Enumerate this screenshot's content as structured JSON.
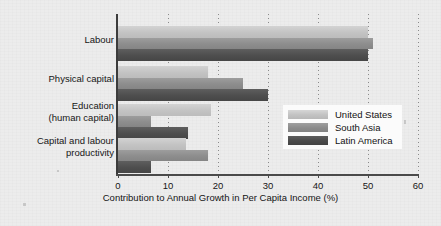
{
  "chart_data": {
    "type": "bar",
    "orientation": "horizontal",
    "title": "",
    "xlabel": "Contribution to Annual Growth in Per Capita Income (%)",
    "ylabel": "",
    "xlim": [
      0,
      60
    ],
    "xticks": [
      0,
      10,
      20,
      30,
      40,
      50,
      60
    ],
    "grid": true,
    "legend_position": "center-right",
    "categories": [
      "Labour",
      "Physical capital",
      "Education\n(human capital)",
      "Capital and labour\nproductivity"
    ],
    "series": [
      {
        "name": "United States",
        "color": "#c6c6c6",
        "values": [
          50,
          18,
          18.5,
          13.5
        ]
      },
      {
        "name": "South Asia",
        "color": "#8d8d8d",
        "values": [
          51,
          25,
          6.5,
          18
        ]
      },
      {
        "name": "Latin America",
        "color": "#4c4c4c",
        "values": [
          50,
          30,
          14,
          6.5
        ]
      }
    ]
  },
  "axis": {
    "tick_labels": [
      "0",
      "10",
      "20",
      "30",
      "40",
      "50",
      "60"
    ],
    "title": "Contribution to Annual Growth in Per Capita Income (%)"
  },
  "categories": {
    "labels": [
      "Labour",
      "Physical capital",
      "Education\n(human capital)",
      "Capital and labour\nproductivity"
    ]
  },
  "legend": {
    "items": [
      {
        "label": "United States"
      },
      {
        "label": "South Asia"
      },
      {
        "label": "Latin America"
      }
    ]
  }
}
